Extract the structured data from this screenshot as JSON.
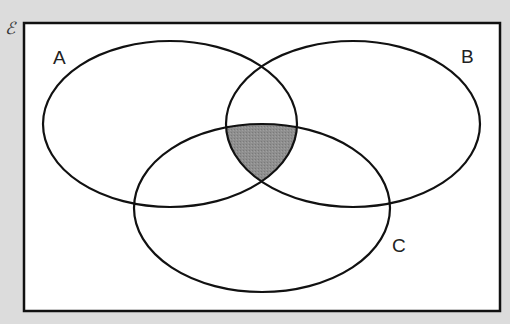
{
  "diagram": {
    "type": "venn",
    "universal_set_symbol": "ℰ",
    "sets": [
      {
        "name": "A",
        "label": "A"
      },
      {
        "name": "B",
        "label": "B"
      },
      {
        "name": "C",
        "label": "C"
      }
    ],
    "shaded_region": "A ∩ B ∩ C",
    "colors": {
      "background": "#dcdcdc",
      "universe_fill": "#ffffff",
      "stroke": "#111111",
      "shade": "#8c8c8c"
    }
  }
}
